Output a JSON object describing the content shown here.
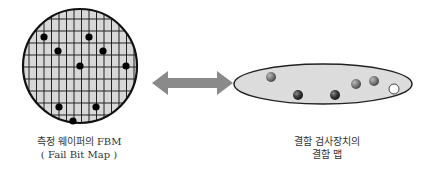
{
  "diagram": {
    "left_caption": {
      "line1": "측정 웨이퍼의 FBM",
      "line2": "( Fail Bit Map )"
    },
    "right_caption": {
      "line1": "결함 검사장치의",
      "line2": "결함 맵"
    },
    "wafer": {
      "shape": "circle-with-grid",
      "fill": "#d8d8d8",
      "stroke": "#111111",
      "defect_count": 9
    },
    "arrow": {
      "type": "double-headed",
      "color": "#8a8a8a"
    },
    "defect_map": {
      "shape": "ellipse",
      "fill": "#dcdcdc",
      "stroke": "#222222",
      "defect_count": 6
    }
  }
}
